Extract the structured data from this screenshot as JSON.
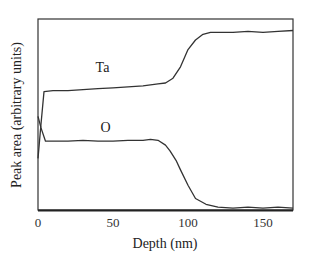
{
  "chart_data": {
    "type": "line",
    "title": "",
    "xlabel": "Depth (nm)",
    "ylabel": "Peak area (arbitrary units)",
    "xlim": [
      0,
      170
    ],
    "ylim": [
      0,
      100
    ],
    "grid": false,
    "legend": "inline labels",
    "x_ticks": [
      0,
      50,
      100,
      150
    ],
    "x_tick_labels": [
      "0",
      "50",
      "100",
      "150"
    ],
    "y_ticks": [],
    "series": [
      {
        "name": "Ta",
        "label_position": {
          "x": 43,
          "y": 72
        },
        "points": [
          [
            0,
            27
          ],
          [
            2,
            45
          ],
          [
            4,
            62
          ],
          [
            10,
            62.5
          ],
          [
            20,
            62.5
          ],
          [
            30,
            63
          ],
          [
            40,
            63.5
          ],
          [
            50,
            64
          ],
          [
            60,
            64.5
          ],
          [
            70,
            65
          ],
          [
            80,
            66
          ],
          [
            85,
            66.5
          ],
          [
            90,
            69
          ],
          [
            95,
            75
          ],
          [
            100,
            84
          ],
          [
            105,
            89
          ],
          [
            110,
            92
          ],
          [
            115,
            93
          ],
          [
            130,
            93
          ],
          [
            140,
            93.5
          ],
          [
            150,
            93
          ],
          [
            160,
            93.5
          ],
          [
            170,
            94
          ]
        ]
      },
      {
        "name": "O",
        "label_position": {
          "x": 45,
          "y": 41
        },
        "points": [
          [
            0,
            49
          ],
          [
            2,
            43
          ],
          [
            5,
            36
          ],
          [
            10,
            36
          ],
          [
            20,
            36
          ],
          [
            30,
            36.5
          ],
          [
            40,
            36
          ],
          [
            50,
            36
          ],
          [
            60,
            36.5
          ],
          [
            70,
            36.5
          ],
          [
            75,
            37
          ],
          [
            80,
            36.5
          ],
          [
            85,
            34
          ],
          [
            88,
            31
          ],
          [
            92,
            26
          ],
          [
            95,
            21
          ],
          [
            100,
            13
          ],
          [
            105,
            6
          ],
          [
            112,
            3
          ],
          [
            120,
            1.5
          ],
          [
            130,
            1
          ],
          [
            140,
            1.5
          ],
          [
            150,
            1
          ],
          [
            160,
            1.5
          ],
          [
            170,
            1
          ]
        ]
      }
    ]
  },
  "colors": {
    "line": "#333333",
    "axis": "#222222",
    "background": "#ffffff"
  }
}
